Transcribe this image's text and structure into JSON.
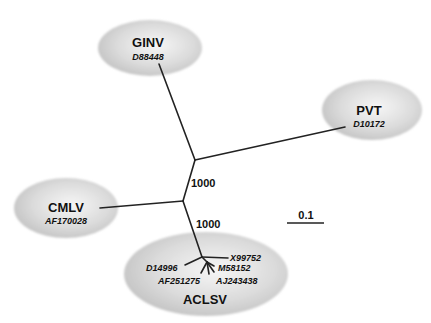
{
  "diagram": {
    "type": "unrooted-phylogenetic-tree",
    "scale_bar": {
      "label": "0.1"
    },
    "bootstrap_values": [
      {
        "node": "internal-upper",
        "value": "1000"
      },
      {
        "node": "internal-lower",
        "value": "1000"
      }
    ],
    "clades": {
      "ginv": {
        "name": "GINV",
        "accessions": [
          "D88448"
        ]
      },
      "pvt": {
        "name": "PVT",
        "accessions": [
          "D10172"
        ]
      },
      "cmlv": {
        "name": "CMLV",
        "accessions": [
          "AF170028"
        ]
      },
      "aclsv": {
        "name": "ACLSV",
        "accessions": [
          "X99752",
          "M58152",
          "AJ243438",
          "D14996",
          "AF251275"
        ]
      }
    },
    "colors": {
      "ellipse_fill": "#d8d8d8",
      "ellipse_highlight": "#f4f4f4",
      "branch": "#222222",
      "text": "#111111"
    }
  }
}
